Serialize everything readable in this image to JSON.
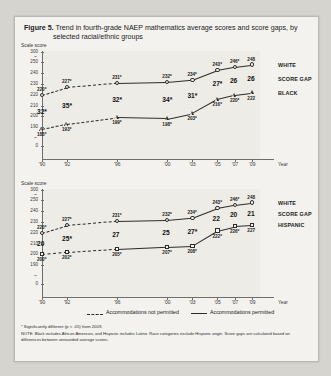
{
  "figure": {
    "label": "Figure 5.",
    "title_line1": "Trend in fourth-grade NAEP mathematics average scores and score gaps, by",
    "title_line2": "selected racial/ethnic groups"
  },
  "axis_title": "Scale score",
  "x_axis_label": "Year",
  "legend": {
    "not_permitted": "Accommodations not permitted",
    "permitted": "Accommodations permitted"
  },
  "footnotes": {
    "significance": "* Significantly different (p < .05) from 2009.",
    "note": "NOTE: Black includes African American, and Hispanic includes Latino. Race categories exclude Hispanic origin. Score gaps are calculated based on differences between unrounded average scores."
  },
  "chart_data": [
    {
      "type": "line",
      "title": "Trend in fourth-grade NAEP mathematics average scores and score gaps, White and Black",
      "xlabel": "Year",
      "ylabel": "Scale score",
      "categories": [
        "'90",
        "'92",
        "'96",
        "'00",
        "'03",
        "'05",
        "'07",
        "'09"
      ],
      "x": [
        1990,
        1992,
        1996,
        2000,
        2003,
        2005,
        2007,
        2009
      ],
      "ylim": [
        180,
        300
      ],
      "ytick_labels": [
        "300",
        "~",
        "250",
        "240",
        "230",
        "220",
        "210",
        "200",
        "190",
        "~",
        "0"
      ],
      "grid": false,
      "legend_position": "right",
      "series": [
        {
          "name": "WHITE",
          "accommodations": [
            "not permitted",
            "not permitted",
            "not permitted",
            "permitted",
            "permitted",
            "permitted",
            "permitted",
            "permitted"
          ],
          "values": [
            220,
            227,
            231,
            232,
            234,
            243,
            246,
            248
          ],
          "labels": [
            "220*",
            "227*",
            "231*",
            "232*",
            "234*",
            "243*",
            "246*",
            "248"
          ],
          "significant": [
            true,
            true,
            true,
            true,
            true,
            true,
            true,
            false
          ]
        },
        {
          "name": "BLACK",
          "accommodations": [
            "not permitted",
            "not permitted",
            "not permitted",
            "permitted",
            "permitted",
            "permitted",
            "permitted",
            "permitted"
          ],
          "values": [
            188,
            193,
            199,
            198,
            203,
            216,
            220,
            222
          ],
          "labels": [
            "188*",
            "193*",
            "199*",
            "198*",
            "203*",
            "216*",
            "220*",
            "222"
          ],
          "significant": [
            true,
            true,
            true,
            true,
            true,
            true,
            true,
            false
          ]
        }
      ],
      "score_gap": {
        "name": "SCORE GAP",
        "values": [
          32,
          35,
          32,
          34,
          31,
          27,
          26,
          26
        ],
        "labels": [
          "32*",
          "35*",
          "32*",
          "34*",
          "31*",
          "27*",
          "26",
          "26"
        ]
      },
      "final_point": {
        "white": 248,
        "black": 222,
        "gap": 26,
        "white_label": "248",
        "black_label": "222",
        "gap_label": "26"
      }
    },
    {
      "type": "line",
      "title": "Trend in fourth-grade NAEP mathematics average scores and score gaps, White and Hispanic",
      "xlabel": "Year",
      "ylabel": "Scale score",
      "categories": [
        "'90",
        "'92",
        "'96",
        "'00",
        "'03",
        "'05",
        "'07",
        "'09"
      ],
      "x": [
        1990,
        1992,
        1996,
        2000,
        2003,
        2005,
        2007,
        2009
      ],
      "ylim": [
        190,
        300
      ],
      "ytick_labels": [
        "300",
        "~",
        "250",
        "240",
        "230",
        "220",
        "210",
        "200",
        "190",
        "~",
        "0"
      ],
      "grid": false,
      "legend_position": "right",
      "series": [
        {
          "name": "WHITE",
          "accommodations": [
            "not permitted",
            "not permitted",
            "not permitted",
            "permitted",
            "permitted",
            "permitted",
            "permitted",
            "permitted"
          ],
          "values": [
            220,
            227,
            231,
            232,
            234,
            243,
            246,
            248
          ],
          "labels": [
            "220*",
            "227*",
            "231*",
            "232*",
            "234*",
            "243*",
            "246*",
            "248"
          ],
          "significant": [
            true,
            true,
            true,
            true,
            true,
            true,
            true,
            false
          ]
        },
        {
          "name": "HISPANIC",
          "accommodations": [
            "not permitted",
            "not permitted",
            "not permitted",
            "permitted",
            "permitted",
            "permitted",
            "permitted",
            "permitted"
          ],
          "values": [
            200,
            202,
            205,
            207,
            208,
            222,
            226,
            227
          ],
          "labels": [
            "200*",
            "202*",
            "205*",
            "207*",
            "208*",
            "222*",
            "226*",
            "227"
          ],
          "significant": [
            true,
            true,
            true,
            true,
            true,
            true,
            true,
            false
          ]
        }
      ],
      "score_gap": {
        "name": "SCORE GAP",
        "values": [
          20,
          25,
          27,
          25,
          27,
          22,
          20,
          21
        ],
        "labels": [
          "20",
          "25*",
          "27",
          "25",
          "27*",
          "22",
          "20",
          "21"
        ]
      },
      "final_point": {
        "white": 248,
        "hispanic": 227,
        "gap": 21,
        "white_label": "248",
        "hispanic_label": "227",
        "gap_label": "21"
      }
    }
  ]
}
